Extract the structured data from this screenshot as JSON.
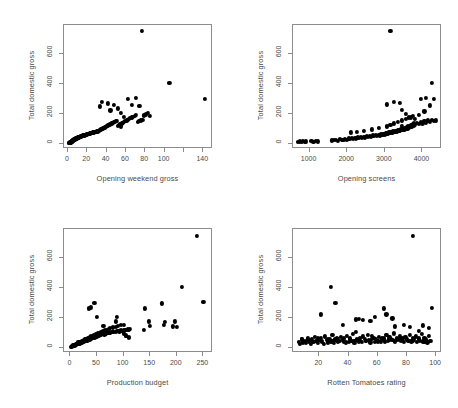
{
  "figure": {
    "layout": "2x2 grid of scatterplots",
    "background": "#ffffff",
    "point_color": "#000000",
    "axis_color": "#8c8c8c",
    "text_color": "#4a4a4a"
  },
  "panels": [
    {
      "id": "panel-opening-weekend-gross",
      "xlabel": "Opening weekend gross",
      "ylabel": "Total domestic gross",
      "xticks": [
        0,
        20,
        40,
        60,
        80,
        100,
        120,
        140
      ],
      "xtick_labels": [
        "0",
        "20",
        "40",
        "60",
        "80",
        "100",
        "",
        "140"
      ],
      "yticks": [
        0,
        200,
        400,
        600
      ],
      "ytick_labels": [
        "0",
        "200",
        "400",
        "600"
      ],
      "xlim": [
        -4,
        150
      ],
      "ylim": [
        -35,
        790
      ]
    },
    {
      "id": "panel-opening-screens",
      "xlabel": "Opening screens",
      "ylabel": "Total domestic gross",
      "xticks": [
        1000,
        2000,
        3000,
        4000
      ],
      "xtick_labels": [
        "1000",
        "2000",
        "3000",
        "4000"
      ],
      "yticks": [
        0,
        200,
        400,
        600
      ],
      "ytick_labels": [
        "0",
        "200",
        "400",
        "600"
      ],
      "xlim": [
        560,
        4520
      ],
      "ylim": [
        -35,
        790
      ]
    },
    {
      "id": "panel-production-budget",
      "xlabel": "Production budget",
      "ylabel": "Total domestic gross",
      "xticks": [
        0,
        50,
        100,
        150,
        200,
        250
      ],
      "xtick_labels": [
        "0",
        "50",
        "100",
        "150",
        "200",
        "250"
      ],
      "yticks": [
        0,
        200,
        400,
        600
      ],
      "ytick_labels": [
        "0",
        "200",
        "400",
        "600"
      ],
      "xlim": [
        -12,
        268
      ],
      "ylim": [
        -35,
        790
      ]
    },
    {
      "id": "panel-rotten-tomatoes-rating",
      "xlabel": "Rotten Tomatoes rating",
      "ylabel": "Total domestic gross",
      "xticks": [
        20,
        40,
        60,
        80,
        100
      ],
      "xtick_labels": [
        "20",
        "40",
        "60",
        "80",
        "100"
      ],
      "yticks": [
        0,
        200,
        400,
        600
      ],
      "ytick_labels": [
        "0",
        "200",
        "400",
        "600"
      ],
      "xlim": [
        2,
        104
      ],
      "ylim": [
        -35,
        790
      ]
    }
  ],
  "chart_data": [
    {
      "type": "scatter",
      "title": "",
      "xlabel": "Opening weekend gross",
      "ylabel": "Total domestic gross",
      "xlim": [
        -4,
        150
      ],
      "ylim": [
        -35,
        790
      ],
      "xticks": [
        0,
        20,
        40,
        60,
        80,
        100,
        120,
        140
      ],
      "yticks": [
        0,
        200,
        400,
        600
      ],
      "grid": false,
      "legend": "none",
      "x": [
        1.2,
        1.5,
        1.8,
        2.1,
        2.3,
        2.6,
        2.8,
        3.0,
        3.2,
        3.4,
        3.6,
        3.8,
        4.0,
        4.2,
        4.4,
        4.6,
        4.8,
        5.0,
        5.2,
        5.4,
        5.6,
        5.8,
        6.0,
        6.2,
        6.5,
        6.8,
        7.0,
        7.2,
        7.5,
        7.8,
        8.0,
        8.3,
        8.6,
        8.9,
        9.2,
        9.5,
        9.8,
        10.1,
        10.4,
        10.8,
        11.2,
        11.5,
        11.9,
        12.3,
        12.7,
        13.1,
        13.5,
        13.9,
        14.3,
        14.8,
        15.2,
        15.6,
        16.1,
        16.5,
        17.0,
        17.5,
        18.0,
        18.4,
        18.9,
        19.4,
        19.9,
        20.4,
        20.9,
        21.4,
        21.9,
        22.4,
        22.9,
        23.4,
        23.9,
        24.4,
        25.0,
        25.5,
        26.1,
        26.6,
        27.2,
        27.8,
        28.4,
        29.0,
        29.6,
        30.2,
        30.8,
        31.5,
        32.1,
        32.8,
        33.5,
        34.2,
        34.9,
        35.6,
        36.3,
        37.0,
        37.8,
        38.5,
        39.3,
        40.1,
        40.9,
        41.7,
        42.5,
        43.4,
        44.2,
        45.1,
        46.0,
        46.9,
        47.8,
        48.8,
        49.7,
        50.7,
        51.7,
        52.8,
        53.8,
        54.9,
        56.0,
        57.1,
        58.3,
        59.5,
        60.7,
        62.0,
        63.3,
        64.6,
        66.0,
        67.4,
        68.9,
        70.4,
        72.0,
        73.6,
        75.3,
        77.0,
        78.8,
        80.7,
        82.7,
        84.7,
        33.0,
        35.5,
        41.0,
        44.0,
        48.0,
        52.0,
        55.0,
        58.0,
        62.0,
        66.0,
        70.0,
        74.0,
        76.5,
        105.0,
        141.5
      ],
      "y": [
        3,
        5,
        4,
        7,
        6,
        9,
        8,
        11,
        10,
        13,
        12,
        15,
        14,
        17,
        16,
        19,
        18,
        21,
        20,
        23,
        22,
        25,
        24,
        27,
        26,
        29,
        28,
        31,
        30,
        33,
        32,
        35,
        34,
        37,
        36,
        39,
        38,
        41,
        40,
        43,
        42,
        45,
        44,
        47,
        46,
        49,
        48,
        51,
        50,
        53,
        52,
        55,
        54,
        57,
        56,
        59,
        58,
        61,
        60,
        63,
        62,
        65,
        64,
        67,
        66,
        69,
        68,
        71,
        70,
        73,
        72,
        75,
        74,
        77,
        76,
        79,
        78,
        81,
        80,
        83,
        82,
        85,
        88,
        90,
        92,
        95,
        98,
        100,
        103,
        106,
        108,
        111,
        114,
        117,
        120,
        123,
        126,
        129,
        132,
        135,
        138,
        141,
        144,
        147,
        150,
        153,
        120,
        125,
        130,
        115,
        135,
        140,
        145,
        150,
        155,
        160,
        165,
        170,
        175,
        180,
        185,
        190,
        145,
        150,
        155,
        160,
        188,
        195,
        205,
        185,
        248,
        278,
        268,
        222,
        260,
        235,
        205,
        180,
        300,
        260,
        305,
        250,
        750,
        405,
        300
      ]
    },
    {
      "type": "scatter",
      "title": "",
      "xlabel": "Opening screens",
      "ylabel": "Total domestic gross",
      "xlim": [
        560,
        4520
      ],
      "ylim": [
        -35,
        790
      ],
      "xticks": [
        1000,
        2000,
        3000,
        4000
      ],
      "yticks": [
        0,
        200,
        400,
        600
      ],
      "grid": false,
      "legend": "none",
      "x": [
        700,
        740,
        790,
        830,
        870,
        910,
        1050,
        1100,
        1160,
        1220,
        1600,
        1650,
        1700,
        1750,
        1800,
        1850,
        1900,
        1950,
        2000,
        2040,
        2080,
        2120,
        2160,
        2200,
        2240,
        2280,
        2320,
        2360,
        2400,
        2440,
        2480,
        2520,
        2560,
        2600,
        2640,
        2680,
        2720,
        2760,
        2800,
        2840,
        2880,
        2900,
        2920,
        2940,
        2960,
        2980,
        3000,
        3020,
        3040,
        3060,
        3080,
        3100,
        3120,
        3140,
        3160,
        3180,
        3200,
        3220,
        3240,
        3260,
        3280,
        3300,
        3320,
        3340,
        3360,
        3380,
        3400,
        3420,
        3440,
        3460,
        3480,
        3500,
        3520,
        3540,
        3560,
        3580,
        3600,
        3620,
        3640,
        3660,
        3680,
        3700,
        3720,
        3740,
        3760,
        3780,
        3800,
        3850,
        3900,
        3950,
        4000,
        4050,
        4100,
        4150,
        4200,
        4250,
        4300,
        4350,
        2100,
        2250,
        2450,
        2650,
        2850,
        3050,
        3150,
        3250,
        3350,
        3450,
        3550,
        3650,
        3750,
        3050,
        3250,
        3450,
        3550,
        3700,
        3900,
        4050,
        4200,
        4300,
        3150,
        3400,
        4250,
        4100,
        3950,
        3800,
        3450
      ],
      "y": [
        12,
        15,
        10,
        18,
        14,
        16,
        20,
        12,
        18,
        15,
        22,
        25,
        28,
        20,
        30,
        24,
        26,
        32,
        28,
        35,
        30,
        38,
        33,
        40,
        36,
        42,
        38,
        45,
        40,
        48,
        42,
        50,
        45,
        52,
        48,
        55,
        50,
        58,
        52,
        60,
        55,
        62,
        58,
        65,
        60,
        68,
        62,
        70,
        65,
        72,
        68,
        75,
        70,
        78,
        72,
        80,
        75,
        82,
        78,
        85,
        80,
        88,
        82,
        90,
        85,
        92,
        88,
        95,
        90,
        98,
        92,
        100,
        95,
        105,
        98,
        110,
        100,
        115,
        105,
        120,
        110,
        125,
        115,
        130,
        120,
        135,
        125,
        140,
        130,
        145,
        135,
        150,
        140,
        155,
        145,
        160,
        150,
        155,
        75,
        80,
        88,
        95,
        105,
        115,
        125,
        135,
        145,
        155,
        165,
        175,
        185,
        262,
        278,
        225,
        200,
        175,
        190,
        215,
        255,
        300,
        750,
        272,
        405,
        305,
        300,
        165,
        118
      ]
    },
    {
      "type": "scatter",
      "title": "",
      "xlabel": "Production budget",
      "ylabel": "Total domestic gross",
      "xlim": [
        -12,
        268
      ],
      "ylim": [
        -35,
        790
      ],
      "xticks": [
        0,
        50,
        100,
        150,
        200,
        250
      ],
      "yticks": [
        0,
        200,
        400,
        600
      ],
      "grid": false,
      "legend": "none",
      "x": [
        2,
        3,
        4,
        5,
        6,
        7,
        8,
        9,
        10,
        11,
        12,
        13,
        14,
        15,
        16,
        17,
        18,
        19,
        20,
        21,
        22,
        23,
        24,
        25,
        26,
        27,
        28,
        29,
        30,
        31,
        32,
        33,
        34,
        35,
        36,
        37,
        38,
        39,
        40,
        41,
        42,
        43,
        44,
        45,
        46,
        47,
        48,
        49,
        50,
        51,
        52,
        53,
        54,
        55,
        56,
        58,
        60,
        62,
        64,
        65,
        66,
        68,
        70,
        72,
        74,
        75,
        78,
        80,
        82,
        85,
        88,
        90,
        92,
        95,
        98,
        100,
        102,
        105,
        108,
        110,
        112,
        15,
        18,
        22,
        25,
        28,
        30,
        33,
        36,
        38,
        42,
        45,
        48,
        52,
        55,
        58,
        62,
        65,
        68,
        72,
        75,
        80,
        85,
        90,
        95,
        100,
        105,
        110,
        35,
        38,
        45,
        50,
        62,
        85,
        88,
        100,
        105,
        110,
        138,
        140,
        148,
        150,
        172,
        175,
        178,
        192,
        196,
        200,
        210,
        237,
        250
      ],
      "y": [
        8,
        12,
        10,
        15,
        14,
        18,
        16,
        20,
        22,
        19,
        25,
        24,
        28,
        26,
        30,
        32,
        29,
        35,
        34,
        38,
        36,
        40,
        42,
        39,
        45,
        44,
        48,
        46,
        50,
        52,
        49,
        55,
        54,
        58,
        56,
        60,
        62,
        59,
        65,
        64,
        68,
        66,
        70,
        72,
        69,
        75,
        74,
        78,
        76,
        80,
        82,
        79,
        85,
        84,
        88,
        86,
        90,
        92,
        89,
        95,
        94,
        98,
        96,
        100,
        102,
        99,
        105,
        104,
        108,
        106,
        110,
        112,
        109,
        115,
        114,
        118,
        116,
        120,
        122,
        119,
        125,
        35,
        40,
        45,
        50,
        55,
        60,
        65,
        70,
        75,
        80,
        85,
        90,
        95,
        100,
        105,
        110,
        115,
        120,
        125,
        130,
        135,
        140,
        145,
        150,
        95,
        82,
        72,
        262,
        268,
        300,
        205,
        145,
        175,
        205,
        152,
        80,
        68,
        120,
        262,
        175,
        145,
        295,
        152,
        170,
        142,
        175,
        138,
        405,
        745,
        305
      ]
    },
    {
      "type": "scatter",
      "title": "",
      "xlabel": "Rotten Tomatoes rating",
      "ylabel": "Total domestic gross",
      "xlim": [
        2,
        104
      ],
      "ylim": [
        -35,
        790
      ],
      "xticks": [
        20,
        40,
        60,
        80,
        100
      ],
      "yticks": [
        0,
        200,
        400,
        600
      ],
      "grid": false,
      "legend": "none",
      "x": [
        6,
        7,
        8,
        9,
        10,
        11,
        12,
        13,
        14,
        15,
        16,
        17,
        18,
        19,
        20,
        21,
        22,
        23,
        24,
        25,
        26,
        27,
        28,
        29,
        30,
        31,
        32,
        33,
        34,
        35,
        36,
        37,
        38,
        39,
        40,
        41,
        42,
        43,
        44,
        45,
        46,
        47,
        48,
        49,
        50,
        51,
        52,
        53,
        54,
        55,
        56,
        57,
        58,
        59,
        60,
        61,
        62,
        63,
        64,
        65,
        66,
        67,
        68,
        69,
        70,
        71,
        72,
        73,
        74,
        75,
        76,
        77,
        78,
        79,
        80,
        81,
        82,
        83,
        84,
        85,
        86,
        87,
        88,
        89,
        90,
        91,
        92,
        93,
        94,
        95,
        96,
        8,
        12,
        15,
        19,
        22,
        26,
        29,
        33,
        37,
        41,
        44,
        48,
        52,
        56,
        60,
        64,
        68,
        72,
        76,
        80,
        84,
        88,
        92,
        20,
        21,
        28,
        31,
        36,
        45,
        47,
        50,
        55,
        58,
        64,
        66,
        70,
        72,
        78,
        82,
        84,
        88,
        91,
        95,
        97
      ],
      "y": [
        40,
        28,
        55,
        35,
        48,
        30,
        62,
        42,
        25,
        58,
        38,
        70,
        45,
        32,
        52,
        65,
        40,
        28,
        75,
        50,
        35,
        60,
        42,
        88,
        30,
        55,
        68,
        38,
        45,
        72,
        50,
        62,
        35,
        80,
        40,
        58,
        48,
        92,
        32,
        105,
        55,
        42,
        68,
        38,
        75,
        60,
        45,
        88,
        52,
        35,
        78,
        65,
        40,
        58,
        48,
        70,
        42,
        62,
        55,
        38,
        85,
        45,
        72,
        60,
        50,
        95,
        42,
        68,
        55,
        80,
        45,
        62,
        38,
        72,
        58,
        48,
        85,
        42,
        65,
        55,
        75,
        38,
        62,
        48,
        92,
        42,
        68,
        55,
        35,
        78,
        45,
        60,
        52,
        48,
        65,
        45,
        58,
        42,
        55,
        38,
        62,
        48,
        52,
        45,
        58,
        42,
        68,
        55,
        48,
        62,
        52,
        45,
        58,
        42,
        52,
        222,
        405,
        300,
        150,
        188,
        192,
        185,
        178,
        205,
        262,
        222,
        195,
        142,
        152,
        138,
        745,
        112,
        148,
        130,
        265,
        298
      ]
    }
  ]
}
